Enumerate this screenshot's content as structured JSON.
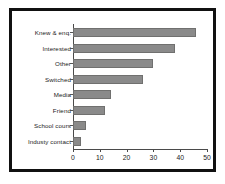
{
  "chart_data": {
    "type": "bar",
    "orientation": "horizontal",
    "title": "",
    "xlabel": "",
    "ylabel": "",
    "xlim": [
      0,
      50
    ],
    "xticks": [
      0,
      10,
      20,
      30,
      40,
      50
    ],
    "grid": false,
    "legend": false,
    "bar_color": "#8a8a8a",
    "categories": [
      "Knew & enq.",
      "Interested",
      "Other",
      "Switched",
      "Media",
      "Friend",
      "School cours",
      "Industy contact"
    ],
    "values": [
      46,
      38,
      30,
      26,
      14,
      12,
      5,
      3
    ]
  }
}
